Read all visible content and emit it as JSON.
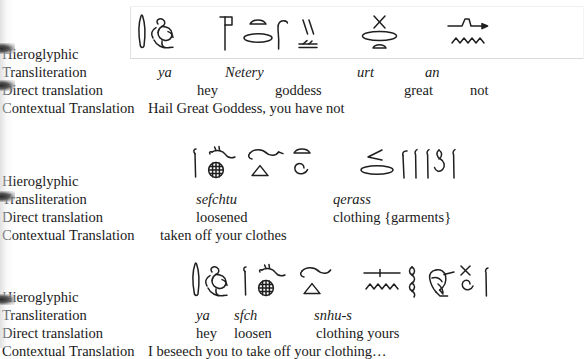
{
  "document": {
    "kind": "scanned-interlinear-gloss",
    "background_color": "#ffffff",
    "text_color": "#1a1a1a",
    "row_labels": {
      "hieroglyphic": "Hieroglyphic",
      "transliteration": "Transliteration",
      "direct_translation": "Direct translation",
      "contextual_translation": "Contextual Translation"
    }
  },
  "blocks": [
    {
      "id": "block-1",
      "labels": {
        "hieroglyphic": "Hieroglyphic",
        "transliteration": "Transliteration",
        "direct_translation": "Direct translation",
        "contextual_translation": "Contextual Translation"
      },
      "transliteration": [
        "ya",
        "Netery",
        "urt",
        "an"
      ],
      "direct_translation": [
        "hey",
        "goddess",
        "great",
        "not"
      ],
      "contextual_translation": "Hail Great Goddess, you have not",
      "glyph_groups": [
        "reed-seated-figure",
        "netjer-flag-loaf-cobra-strokes",
        "urt-swallow-loaf",
        "an-water-ripple"
      ]
    },
    {
      "id": "block-2",
      "labels": {
        "hieroglyphic": "Hieroglyphic",
        "transliteration": "Transliteration",
        "direct_translation": "Direct translation",
        "contextual_translation": "Contextual Translation"
      },
      "transliteration": [
        "sefchtu",
        "qerass"
      ],
      "direct_translation": [
        "loosened",
        "clothing {garments}"
      ],
      "contextual_translation": "taken off your clothes",
      "glyph_groups": [
        "sefchtu-group",
        "qerass-group"
      ]
    },
    {
      "id": "block-3",
      "labels": {
        "hieroglyphic": "Hieroglyphic",
        "transliteration": "Transliteration",
        "direct_translation": "Direct translation",
        "contextual_translation": "Contextual Translation"
      },
      "transliteration": [
        "ya",
        "sfch",
        "snhu-s"
      ],
      "direct_translation": [
        "hey",
        "loosen",
        "clothing yours"
      ],
      "contextual_translation": "I beseech you to take off your clothing…",
      "glyph_groups": [
        "reed-seated-figure",
        "sfch-group",
        "snhu-s-group"
      ]
    }
  ]
}
